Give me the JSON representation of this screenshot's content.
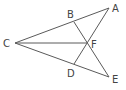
{
  "diagram": {
    "type": "geometry",
    "points": {
      "A": {
        "label": "A",
        "x": 109,
        "y": 8,
        "lx": 112,
        "ly": 12
      },
      "B": {
        "label": "B",
        "x": 74,
        "y": 22,
        "lx": 67,
        "ly": 18
      },
      "C": {
        "label": "C",
        "x": 15,
        "y": 43,
        "lx": 3,
        "ly": 47
      },
      "D": {
        "label": "D",
        "x": 74,
        "y": 64,
        "lx": 67,
        "ly": 77
      },
      "E": {
        "label": "E",
        "x": 109,
        "y": 77,
        "lx": 112,
        "ly": 83
      },
      "F": {
        "label": "F",
        "x": 87,
        "y": 43,
        "lx": 91,
        "ly": 48
      }
    },
    "segments": [
      [
        "C",
        "A"
      ],
      [
        "C",
        "F"
      ],
      [
        "C",
        "E"
      ],
      [
        "B",
        "E"
      ],
      [
        "D",
        "A"
      ]
    ],
    "colors": {
      "stroke": "#5a5a5a",
      "label": "#444444"
    }
  }
}
